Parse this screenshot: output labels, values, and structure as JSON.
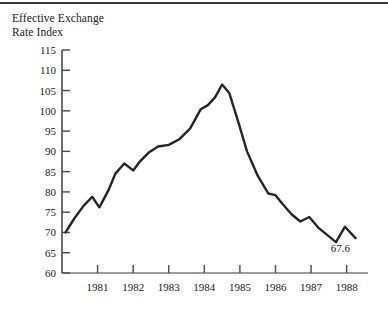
{
  "figure": {
    "title": "Effective Exchange\nRate Index",
    "end_label": "67.6"
  },
  "chart_data": {
    "type": "line",
    "title": "Effective Exchange Rate Index",
    "xlabel": "",
    "ylabel": "Effective Exchange Rate Index",
    "xlim": [
      1980.0,
      1988.6
    ],
    "ylim": [
      60,
      115
    ],
    "yticks": [
      60,
      65,
      70,
      75,
      80,
      85,
      90,
      95,
      100,
      105,
      110,
      115
    ],
    "xticks": [
      1981,
      1982,
      1983,
      1984,
      1985,
      1986,
      1987,
      1988
    ],
    "xtick_labels": [
      "1981",
      "1982",
      "1983",
      "1984",
      "1985",
      "1986",
      "1987",
      "1988"
    ],
    "ytick_labels": [
      "60",
      "65",
      "70",
      "75",
      "80",
      "85",
      "90",
      "95",
      "100",
      "105",
      "110",
      "115"
    ],
    "grid": false,
    "legend": false,
    "line_color": "#262626",
    "line_width": 2.4,
    "annotations": [
      {
        "text": "67.6",
        "x": 1987.95,
        "y": 66.0
      }
    ],
    "series": [
      {
        "name": "Effective Exchange Rate Index",
        "x": [
          1980.1,
          1980.35,
          1980.6,
          1980.85,
          1981.05,
          1981.3,
          1981.5,
          1981.75,
          1982.0,
          1982.2,
          1982.45,
          1982.7,
          1983.0,
          1983.3,
          1983.6,
          1983.9,
          1984.1,
          1984.3,
          1984.5,
          1984.7,
          1984.95,
          1985.2,
          1985.5,
          1985.8,
          1986.0,
          1986.2,
          1986.45,
          1986.7,
          1986.95,
          1987.2,
          1987.45,
          1987.7,
          1987.95,
          1988.25
        ],
        "y": [
          70.0,
          73.5,
          76.5,
          78.8,
          76.2,
          80.3,
          84.5,
          87.0,
          85.3,
          87.6,
          89.8,
          91.2,
          91.6,
          93.0,
          95.6,
          100.4,
          101.4,
          103.3,
          106.5,
          104.4,
          97.4,
          90.0,
          84.0,
          79.6,
          79.2,
          77.0,
          74.5,
          72.7,
          73.8,
          71.2,
          69.4,
          67.6,
          71.4,
          68.6
        ]
      }
    ]
  }
}
